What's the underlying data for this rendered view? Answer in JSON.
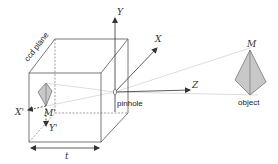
{
  "diagram": {
    "labels": {
      "ccd_plane": "ccd plane",
      "pinhole": "pinhole",
      "object": "object",
      "axis_x": "X",
      "axis_y": "Y",
      "axis_z": "Z",
      "point_m": "M",
      "point_m_image": "M'",
      "axis_x_image": "X'",
      "axis_y_image": "Y'",
      "focal_length": "t"
    },
    "colors": {
      "line": "#555555",
      "dashed": "#777777",
      "ray": "#cccccc",
      "fill": "#c8c8c8",
      "text": "#222222"
    }
  }
}
